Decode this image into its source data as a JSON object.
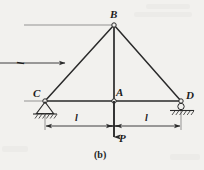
{
  "figure": {
    "caption": "(b)",
    "background_color": "#f2f1ee",
    "line_color": "#2a2a2a",
    "nodes": [
      {
        "id": "B",
        "label": "B",
        "x": 114,
        "y": 25,
        "type": "joint"
      },
      {
        "id": "C",
        "label": "C",
        "x": 45,
        "y": 101,
        "type": "pin-support"
      },
      {
        "id": "A",
        "label": "A",
        "x": 114,
        "y": 101,
        "type": "joint"
      },
      {
        "id": "D",
        "label": "D",
        "x": 181,
        "y": 101,
        "type": "roller-support"
      }
    ],
    "members": [
      {
        "from": "C",
        "to": "B"
      },
      {
        "from": "B",
        "to": "D"
      },
      {
        "from": "C",
        "to": "D"
      },
      {
        "from": "B",
        "to": "A"
      }
    ],
    "load": {
      "label": "P",
      "direction": "down",
      "applied_at": "A",
      "tail_y": 101,
      "head_y": 137
    },
    "dimensions": [
      {
        "name": "height",
        "label": "l",
        "orientation": "vertical",
        "from": "B",
        "to": "C"
      },
      {
        "name": "left-span",
        "label": "l",
        "orientation": "horizontal",
        "from": "C",
        "to": "A"
      },
      {
        "name": "right-span",
        "label": "l",
        "orientation": "horizontal",
        "from": "A",
        "to": "D"
      }
    ]
  }
}
